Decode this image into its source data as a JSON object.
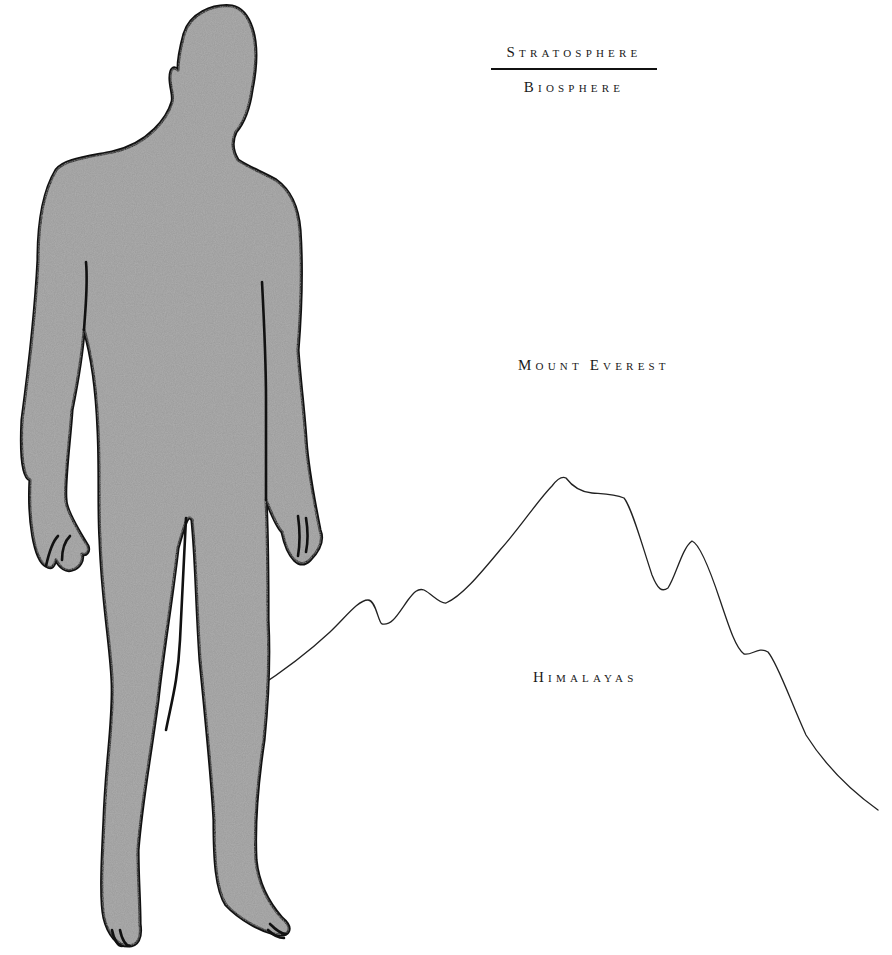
{
  "labels": {
    "numerator": {
      "first": "S",
      "rest": "tratosphere"
    },
    "denominator": {
      "first": "B",
      "rest": "iosphere"
    },
    "peak": {
      "first": "M",
      "rest": "ount ",
      "first2": "E",
      "rest2": "verest"
    },
    "range": {
      "first": "H",
      "rest": "imalayas"
    }
  },
  "colors": {
    "figure_fill": "#9a9a9a",
    "outline": "#111111",
    "mountain_line": "#222222",
    "background": "#ffffff"
  },
  "figure": {
    "name": "standing human silhouette",
    "comparison": "human height vs. Mount Everest"
  }
}
